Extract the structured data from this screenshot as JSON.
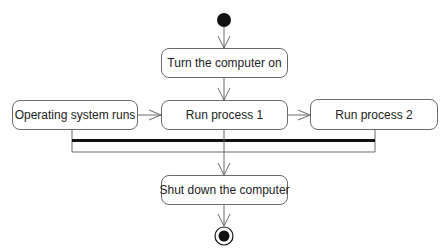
{
  "diagram": {
    "type": "UML activity diagram",
    "initial_node": {
      "label": ""
    },
    "actions": [
      {
        "id": "turn-on",
        "label": "Turn the computer on"
      },
      {
        "id": "os-runs",
        "label": "Operating system runs"
      },
      {
        "id": "process-1",
        "label": "Run process 1"
      },
      {
        "id": "process-2",
        "label": "Run process 2"
      },
      {
        "id": "shut-down",
        "label": "Shut down the computer"
      }
    ],
    "edges": [
      {
        "from": "initial",
        "to": "turn-on"
      },
      {
        "from": "turn-on",
        "to": "process-1"
      },
      {
        "from": "os-runs",
        "to": "process-1"
      },
      {
        "from": "process-1",
        "to": "process-2"
      },
      {
        "from": "os-runs",
        "to": "join-bar"
      },
      {
        "from": "process-1",
        "to": "join-bar"
      },
      {
        "from": "process-2",
        "to": "join-bar"
      },
      {
        "from": "join-bar",
        "to": "shut-down"
      },
      {
        "from": "shut-down",
        "to": "final"
      }
    ],
    "colors": {
      "line": "#6a6a6a",
      "bar": "#111111",
      "node_fill": "#ffffff",
      "text": "#222222"
    }
  }
}
